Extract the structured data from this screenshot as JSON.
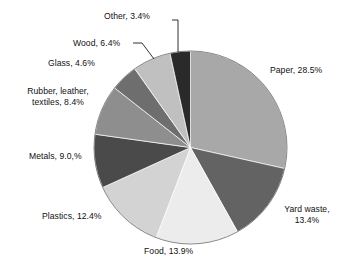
{
  "chart_data": {
    "type": "pie",
    "title": "",
    "subtitle": "",
    "xlabel": "",
    "ylabel": "",
    "legend_position": "none",
    "grid": false,
    "labels_inline": true,
    "start_angle_deg": 0,
    "direction": "clockwise",
    "categories": [
      "Paper",
      "Yard waste",
      "Food",
      "Plastics",
      "Metals",
      "Rubber, leather, textiles",
      "Glass",
      "Wood",
      "Other"
    ],
    "values": [
      28.5,
      13.4,
      13.9,
      12.4,
      9.0,
      8.4,
      4.6,
      6.4,
      3.4
    ],
    "unit": "%",
    "colors": [
      "#a8a8a8",
      "#636363",
      "#ececec",
      "#d3d3d3",
      "#4a4a4a",
      "#8e8e8e",
      "#6e6e6e",
      "#c0c0c0",
      "#2a2a2a"
    ],
    "slice_labels": [
      "Paper, 28.5%",
      "Yard waste, 13.4%",
      "Food, 13.9%",
      "Plastics, 12.4%",
      "Metals, 9.0,%",
      "Rubber, leather, textiles, 8.4%",
      "Glass, 4.6%",
      "Wood, 6.4%",
      "Other, 3.4%"
    ]
  },
  "labels": {
    "paper": "Paper, 28.5%",
    "yard_waste_line1": "Yard waste,",
    "yard_waste_line2": "13.4%",
    "food": "Food, 13.9%",
    "plastics": "Plastics, 12.4%",
    "metals": "Metals, 9.0,%",
    "rubber_line1": "Rubber, leather,",
    "rubber_line2": "textiles, 8.4%",
    "glass": "Glass, 4.6%",
    "wood": "Wood, 6.4%",
    "other": "Other, 3.4%"
  }
}
